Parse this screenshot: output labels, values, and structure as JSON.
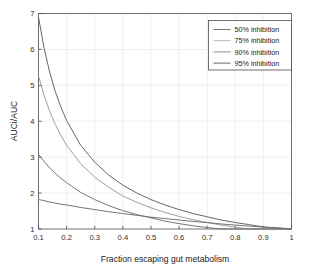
{
  "chart_data": {
    "type": "line",
    "title": "",
    "xlabel": "Fraction escaping gut metabolism",
    "ylabel": "AUCi/AUC",
    "xlim": [
      0.1,
      1
    ],
    "ylim": [
      1,
      7
    ],
    "xticks": [
      "0.1",
      "0.2",
      "0.3",
      "0.4",
      "0.5",
      "0.6",
      "0.7",
      "0.8",
      "0.9",
      "1"
    ],
    "xtick_values": [
      0.1,
      0.2,
      0.3,
      0.4,
      0.5,
      0.6,
      0.7,
      0.8,
      0.9,
      1.0
    ],
    "yticks": [
      "1",
      "2",
      "3",
      "4",
      "5",
      "6",
      "7"
    ],
    "ytick_values": [
      1,
      2,
      3,
      4,
      5,
      6,
      7
    ],
    "grid": true,
    "legend_position": "top-right",
    "x": [
      0.1,
      0.12,
      0.14,
      0.16,
      0.18,
      0.2,
      0.25,
      0.3,
      0.35,
      0.4,
      0.45,
      0.5,
      0.55,
      0.6,
      0.65,
      0.7,
      0.75,
      0.8,
      0.85,
      0.9,
      0.95,
      1.0
    ],
    "series": [
      {
        "name": "95% inhibition",
        "color": "#5f5f5f",
        "inhibition": 0.95,
        "values": [
          6.9,
          6.03,
          5.36,
          4.82,
          4.39,
          4.02,
          3.33,
          2.86,
          2.5,
          2.22,
          2.0,
          1.82,
          1.67,
          1.54,
          1.43,
          1.34,
          1.25,
          1.18,
          1.12,
          1.06,
          1.03,
          1.0
        ]
      },
      {
        "name": "90% inhibition",
        "color": "#9a9a9a",
        "inhibition": 0.9,
        "values": [
          5.26,
          4.72,
          4.27,
          3.91,
          3.6,
          3.33,
          2.82,
          2.44,
          2.16,
          1.92,
          1.74,
          1.59,
          1.46,
          1.35,
          1.26,
          1.18,
          1.11,
          1.05,
          1.0,
          1.0,
          1.0,
          1.0
        ]
      },
      {
        "name": "75% inhibition",
        "color": "#6e6e6e",
        "inhibition": 0.75,
        "values": [
          3.08,
          2.88,
          2.7,
          2.55,
          2.41,
          2.29,
          2.02,
          1.82,
          1.65,
          1.51,
          1.4,
          1.31,
          1.22,
          1.15,
          1.09,
          1.04,
          1.0,
          1.0,
          1.0,
          1.0,
          1.0,
          1.0
        ]
      },
      {
        "name": "50% inhibition",
        "color": "#6e6e6e",
        "inhibition": 0.5,
        "values": [
          1.82,
          1.79,
          1.75,
          1.72,
          1.69,
          1.67,
          1.6,
          1.54,
          1.48,
          1.43,
          1.38,
          1.33,
          1.29,
          1.25,
          1.21,
          1.18,
          1.14,
          1.11,
          1.08,
          1.05,
          1.03,
          1.0
        ]
      }
    ],
    "legend_entries": [
      {
        "label": "50% inhibition",
        "color": "#6e6e6e"
      },
      {
        "label": "75% inhibition",
        "color": "#b4b4b4"
      },
      {
        "label": "90% inhibition",
        "color": "#8a8a8a"
      },
      {
        "label": "95% inhibition",
        "color": "#5f5f5f"
      }
    ]
  },
  "colors": {
    "background": "#ffffff",
    "axis": "#4d4d4d",
    "grid": "#e8e8e8",
    "text": "#1a1a1a"
  }
}
